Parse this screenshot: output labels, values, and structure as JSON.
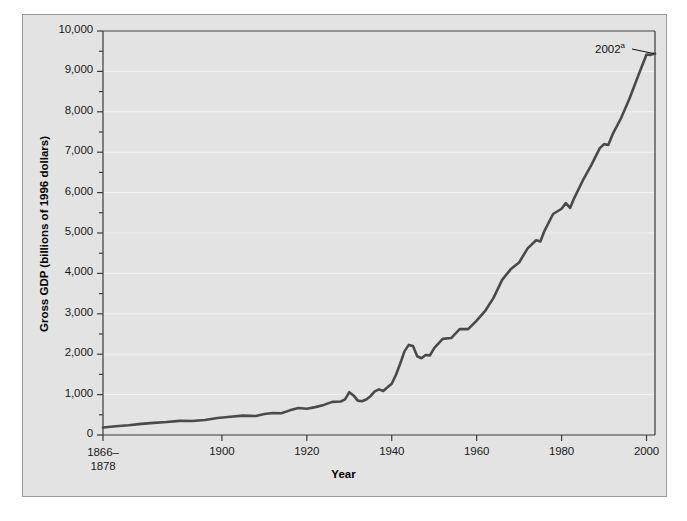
{
  "chart_data": {
    "type": "line",
    "title": "",
    "xlabel": "Year",
    "ylabel": "Gross GDP (billions of 1996 dollars)",
    "xlim": [
      1872,
      2002
    ],
    "ylim": [
      0,
      10000
    ],
    "grid": true,
    "grid_axis": "y",
    "legend": "none",
    "y_ticks_major": [
      "0",
      "1,000",
      "2,000",
      "3,000",
      "4,000",
      "5,000",
      "6,000",
      "7,000",
      "8,000",
      "9,000",
      "10,000"
    ],
    "y_tick_values": [
      0,
      1000,
      2000,
      3000,
      4000,
      5000,
      6000,
      7000,
      8000,
      9000,
      10000
    ],
    "y_minor_tick_values": [
      500,
      1500,
      2500,
      3500,
      4500,
      5500,
      6500,
      7500,
      8500,
      9500
    ],
    "x_ticks": [
      {
        "label": "1866–\n1878",
        "line1": "1866–",
        "line2": "1878",
        "value": 1872
      },
      {
        "label": "1900",
        "line1": "1900",
        "line2": "",
        "value": 1900
      },
      {
        "label": "1920",
        "line1": "1920",
        "line2": "",
        "value": 1920
      },
      {
        "label": "1940",
        "line1": "1940",
        "line2": "",
        "value": 1940
      },
      {
        "label": "1960",
        "line1": "1960",
        "line2": "",
        "value": 1960
      },
      {
        "label": "1980",
        "line1": "1980",
        "line2": "",
        "value": 1980
      },
      {
        "label": "2000",
        "line1": "2000",
        "line2": "",
        "value": 2000
      }
    ],
    "annotations": [
      {
        "text": "2002",
        "superscript": "a",
        "point_x": 2002,
        "point_y": 9440
      }
    ],
    "series": [
      {
        "name": "Gross GDP",
        "color": "#4a4a4a",
        "x": [
          1872,
          1875,
          1878,
          1881,
          1884,
          1887,
          1890,
          1893,
          1896,
          1899,
          1902,
          1905,
          1908,
          1910,
          1912,
          1914,
          1916,
          1918,
          1920,
          1922,
          1924,
          1926,
          1928,
          1929,
          1930,
          1931,
          1932,
          1933,
          1934,
          1935,
          1936,
          1937,
          1938,
          1939,
          1940,
          1941,
          1942,
          1943,
          1944,
          1945,
          1946,
          1947,
          1948,
          1949,
          1950,
          1952,
          1954,
          1956,
          1958,
          1960,
          1962,
          1964,
          1966,
          1968,
          1970,
          1972,
          1974,
          1975,
          1976,
          1978,
          1980,
          1981,
          1982,
          1983,
          1985,
          1987,
          1989,
          1990,
          1991,
          1992,
          1994,
          1996,
          1998,
          2000,
          2001,
          2002
        ],
        "y": [
          185,
          215,
          240,
          275,
          300,
          320,
          350,
          345,
          370,
          420,
          450,
          480,
          470,
          520,
          545,
          540,
          610,
          670,
          650,
          690,
          745,
          820,
          830,
          880,
          1060,
          980,
          850,
          835,
          880,
          960,
          1080,
          1130,
          1090,
          1180,
          1270,
          1490,
          1770,
          2070,
          2230,
          2200,
          1950,
          1900,
          1980,
          1970,
          2150,
          2380,
          2400,
          2620,
          2620,
          2830,
          3070,
          3400,
          3840,
          4100,
          4270,
          4620,
          4820,
          4790,
          5060,
          5470,
          5600,
          5740,
          5620,
          5870,
          6300,
          6680,
          7100,
          7200,
          7180,
          7440,
          7840,
          8330,
          8880,
          9420,
          9410,
          9440
        ]
      }
    ]
  },
  "axis": {
    "y_title": "Gross GDP (billions of 1996 dollars)",
    "x_title": "Year"
  },
  "annotation": {
    "label": "2002",
    "superscript": "a"
  },
  "colors": {
    "panel_background": "#e3e3e3",
    "plot_background": "#e3e3e3",
    "line": "#4a4a4a",
    "axis": "#3a3a3a",
    "grid": "#f2f2f2",
    "frame_border": "#9a9a9a",
    "text": "#111111"
  }
}
